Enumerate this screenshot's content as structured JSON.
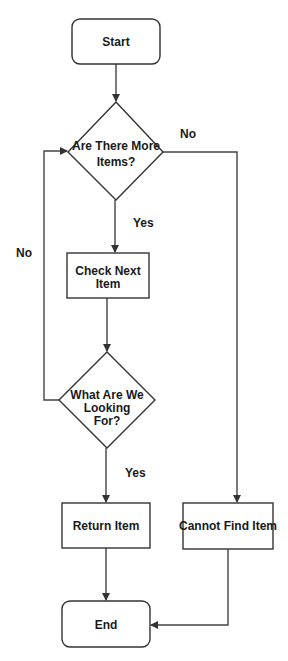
{
  "diagram": {
    "type": "flowchart",
    "colors": {
      "background": "#ffffff",
      "stroke": "#333333",
      "text": "#1a1a1a"
    },
    "nodes": {
      "start": {
        "shape": "rounded-rect",
        "label": "Start"
      },
      "more_items": {
        "shape": "diamond",
        "line1": "Are There More",
        "line2": "Items?"
      },
      "check_next": {
        "shape": "rect",
        "line1": "Check Next",
        "line2": "Item"
      },
      "looking_for": {
        "shape": "diamond",
        "line1": "What Are We",
        "line2": "Looking",
        "line3": "For?"
      },
      "return_item": {
        "shape": "rect",
        "label": "Return Item"
      },
      "cannot_find": {
        "shape": "rect",
        "label": "Cannot Find Item"
      },
      "end": {
        "shape": "rounded-rect",
        "label": "End"
      }
    },
    "edges": [
      {
        "from": "start",
        "to": "more_items",
        "label": ""
      },
      {
        "from": "more_items",
        "to": "check_next",
        "label": "Yes"
      },
      {
        "from": "more_items",
        "to": "cannot_find",
        "label": "No"
      },
      {
        "from": "check_next",
        "to": "looking_for",
        "label": ""
      },
      {
        "from": "looking_for",
        "to": "return_item",
        "label": "Yes"
      },
      {
        "from": "looking_for",
        "to": "more_items",
        "label": "No"
      },
      {
        "from": "return_item",
        "to": "end",
        "label": ""
      },
      {
        "from": "cannot_find",
        "to": "end",
        "label": ""
      }
    ],
    "edge_labels": {
      "more_items_yes": "Yes",
      "more_items_no": "No",
      "looking_for_yes": "Yes",
      "looking_for_no": "No"
    }
  }
}
